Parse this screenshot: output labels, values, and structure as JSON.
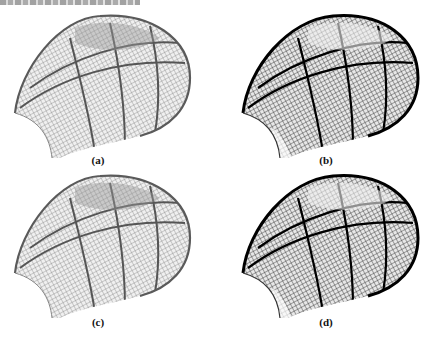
{
  "figure": {
    "panels": [
      {
        "id": "a",
        "label": "(a)",
        "style": "light",
        "stroke": "#6a6a6a",
        "rib": "#4a4a4a"
      },
      {
        "id": "b",
        "label": "(b)",
        "style": "dark",
        "stroke": "#1e1e1e",
        "rib": "#000000"
      },
      {
        "id": "c",
        "label": "(c)",
        "style": "light",
        "stroke": "#6a6a6a",
        "rib": "#4a4a4a"
      },
      {
        "id": "d",
        "label": "(d)",
        "style": "dark",
        "stroke": "#1e1e1e",
        "rib": "#000000"
      }
    ]
  }
}
